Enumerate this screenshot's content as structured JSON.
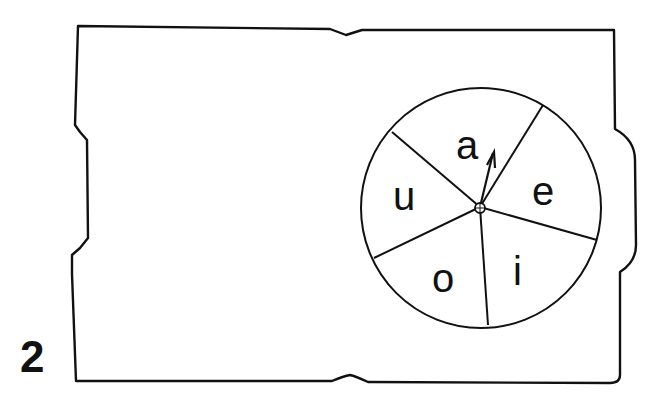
{
  "figure": {
    "number": "2",
    "card": {
      "stroke": "#111111"
    },
    "spinner": {
      "sectors": [
        "a",
        "e",
        "i",
        "o",
        "u"
      ],
      "pointer_label": "a"
    }
  }
}
